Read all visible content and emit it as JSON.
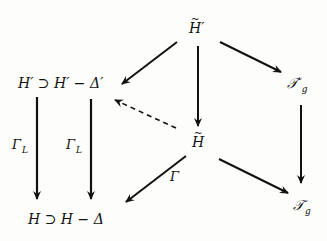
{
  "nodes": {
    "h_tilde_prime": {
      "tilde": "~",
      "base": "H",
      "prime": "′"
    },
    "h_prime_minus_delta_prime": {
      "text": "H′ ⊃ H′ − Δ′"
    },
    "t_prime_g": {
      "base": "𝒯",
      "prime": "'",
      "sub": "g"
    },
    "h_tilde": {
      "tilde": "~",
      "base": "H"
    },
    "h_minus_delta": {
      "text": "H ⊃ H − Δ"
    },
    "t_g": {
      "base": "𝒯",
      "sub": "g"
    }
  },
  "labels": {
    "gamma_l_left": {
      "base": "Γ",
      "sub": "L"
    },
    "gamma_l_right": {
      "base": "Γ",
      "sub": "L"
    },
    "gamma": {
      "text": "Γ"
    }
  },
  "arrows": [
    {
      "from": "h_tilde_prime",
      "to": "h_prime_minus_delta_prime",
      "style": "solid"
    },
    {
      "from": "h_tilde_prime",
      "to": "h_tilde",
      "style": "solid"
    },
    {
      "from": "h_tilde_prime",
      "to": "t_prime_g",
      "style": "solid"
    },
    {
      "from": "h_tilde",
      "to": "h_prime_minus_delta_prime",
      "style": "dashed"
    },
    {
      "from": "h_tilde",
      "to": "h_minus_delta",
      "style": "solid",
      "label": "Γ"
    },
    {
      "from": "h_tilde",
      "to": "t_g",
      "style": "solid"
    },
    {
      "from": "t_prime_g",
      "to": "t_g",
      "style": "solid"
    },
    {
      "from": "h_prime",
      "to": "h",
      "style": "solid",
      "label": "Γ_L"
    },
    {
      "from": "h_prime_minus_delta_prime",
      "to": "h_minus_delta",
      "style": "solid",
      "label": "Γ_L"
    }
  ],
  "colors": {
    "ink": "#111111",
    "paper": "#fdfdfb"
  }
}
